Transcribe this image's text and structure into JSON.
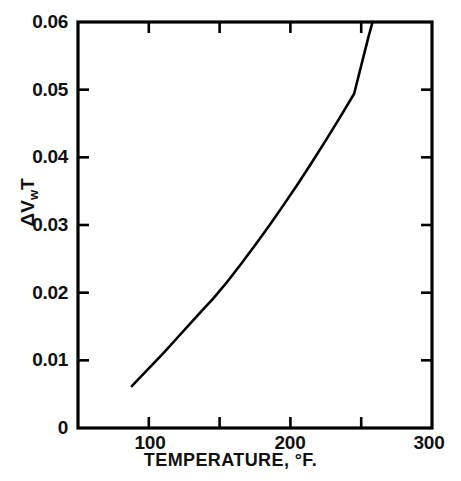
{
  "figure": {
    "background_color": "#ffffff",
    "line_color": "#000000",
    "axis_color": "#000000"
  },
  "axis_titles": {
    "x": "TEMPERATURE, °F.",
    "y_main": "ΔV",
    "y_sub": "w",
    "y_tail": "T",
    "y_full": "ΔVwT"
  },
  "y_ticks": [
    {
      "value": 0.06,
      "label": "0.06"
    },
    {
      "value": 0.05,
      "label": "0.05"
    },
    {
      "value": 0.04,
      "label": "0.04"
    },
    {
      "value": 0.03,
      "label": "0.03"
    },
    {
      "value": 0.02,
      "label": "0.02"
    },
    {
      "value": 0.01,
      "label": "0.01"
    },
    {
      "value": 0.0,
      "label": "0"
    }
  ],
  "x_ticks": [
    {
      "value": 100,
      "label": "100"
    },
    {
      "value": 150,
      "label": ""
    },
    {
      "value": 200,
      "label": "200"
    },
    {
      "value": 250,
      "label": ""
    },
    {
      "value": 300,
      "label": "300"
    }
  ],
  "chart_data": {
    "type": "line",
    "title": "",
    "subtitle": "",
    "xlabel": "TEMPERATURE, °F.",
    "ylabel": "ΔVwT",
    "xlim": [
      50,
      300
    ],
    "ylim": [
      0,
      0.06
    ],
    "xticks": [
      100,
      150,
      200,
      250,
      300
    ],
    "xticklabels": [
      "100",
      "",
      "200",
      "",
      "300"
    ],
    "yticks": [
      0,
      0.01,
      0.02,
      0.03,
      0.04,
      0.05,
      0.06
    ],
    "yticklabels": [
      "0",
      "0.01",
      "0.02",
      "0.03",
      "0.04",
      "0.05",
      "0.06"
    ],
    "grid": false,
    "legend": null,
    "annotations": [],
    "series": [
      {
        "name": "ΔVwT vs temperature",
        "x": [
          88,
          100,
          110,
          120,
          130,
          140,
          145,
          155,
          165,
          175,
          185,
          195,
          205,
          215,
          225,
          235,
          245,
          255,
          258
        ],
        "y": [
          0.0062,
          0.0088,
          0.011,
          0.0133,
          0.0156,
          0.0179,
          0.019,
          0.0215,
          0.0242,
          0.027,
          0.0299,
          0.0329,
          0.036,
          0.0392,
          0.0425,
          0.0459,
          0.0494,
          0.0577,
          0.06
        ]
      }
    ]
  }
}
